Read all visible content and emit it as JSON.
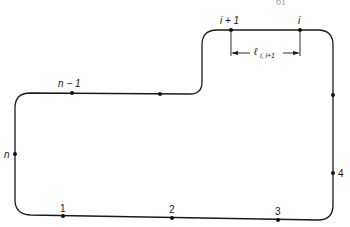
{
  "page_number": "61",
  "diagram": {
    "stroke_color": "#1a1a1a",
    "points": [
      {
        "label": "i + 1",
        "italic": true
      },
      {
        "label": "i",
        "italic": true
      },
      {
        "label": "n − 1",
        "italic": true
      },
      {
        "label": "n",
        "italic": true
      },
      {
        "label": "1",
        "italic": false
      },
      {
        "label": "2",
        "italic": false
      },
      {
        "label": "3",
        "italic": false
      },
      {
        "label": "4",
        "italic": false
      }
    ],
    "dimension_label": {
      "main": "ℓ",
      "subscript": "i, i+1"
    }
  }
}
